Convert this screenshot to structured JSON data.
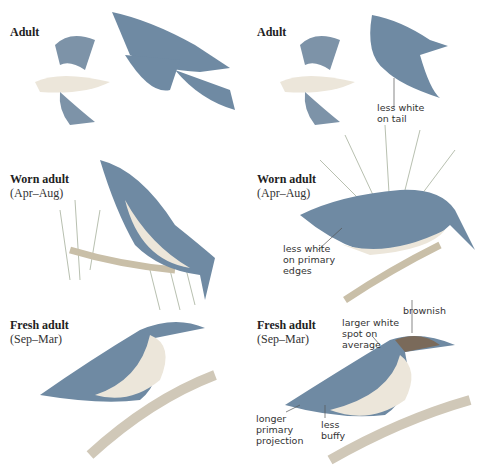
{
  "header": {
    "clipped_text": "species comparison plate (top text clipped)"
  },
  "left_column": [
    {
      "title": "Adult",
      "subtitle": ""
    },
    {
      "title": "Worn adult",
      "subtitle": "(Apr–Aug)"
    },
    {
      "title": "Fresh adult",
      "subtitle": "(Sep–Mar)"
    }
  ],
  "right_column": [
    {
      "title": "Adult",
      "subtitle": "",
      "notes": [
        "less white\non tail"
      ]
    },
    {
      "title": "Worn adult",
      "subtitle": "(Apr–Aug)",
      "notes": [
        "less white\non primary\nedges"
      ]
    },
    {
      "title": "Fresh adult",
      "subtitle": "(Sep–Mar)",
      "notes": [
        "brownish",
        "larger white\nspot on\naverage",
        "longer\nprimary\nprojection",
        "less\nbuffy"
      ]
    }
  ],
  "colors": {
    "back": "#6f8aa3",
    "belly": "#ece6da",
    "cap": "#7a6a5a",
    "branch": "#c9bfa8",
    "needle": "#b8c0b0"
  }
}
